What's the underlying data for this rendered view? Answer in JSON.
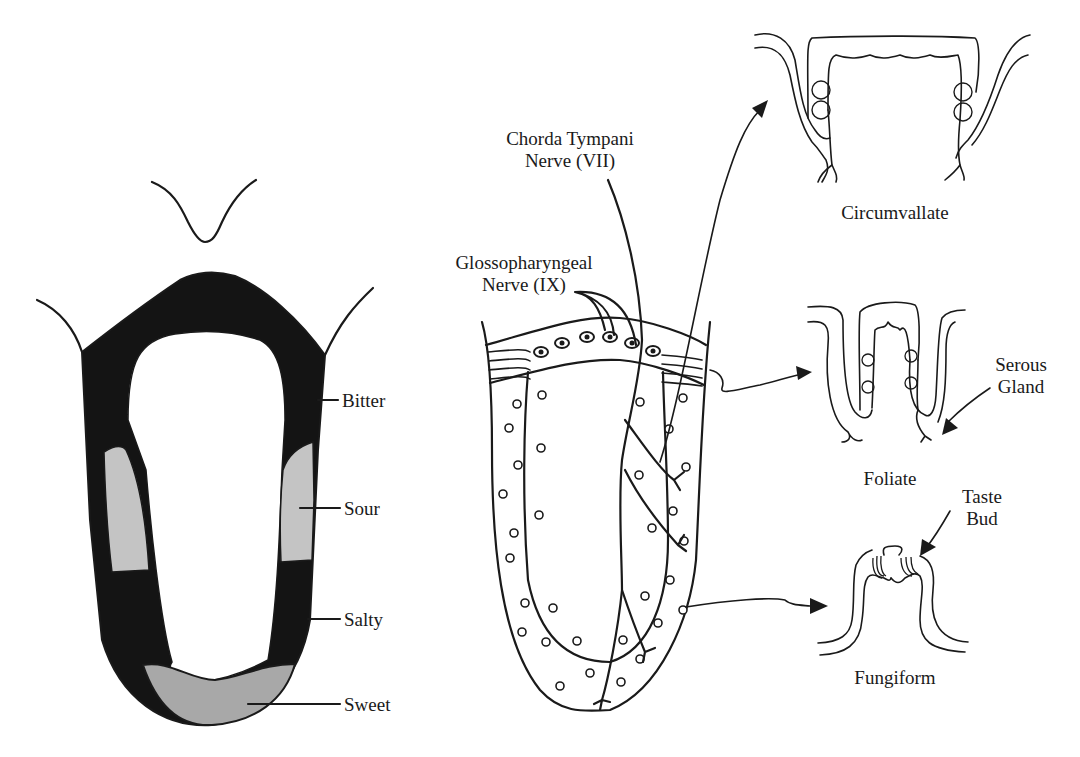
{
  "tongue_map": {
    "regions": [
      {
        "label": "Bitter",
        "fill": "#141414"
      },
      {
        "label": "Sour",
        "fill": "#c4c4c4"
      },
      {
        "label": "Salty",
        "fill": "#141414"
      },
      {
        "label": "Sweet",
        "fill": "#a8a8a8"
      }
    ]
  },
  "nerves": {
    "chorda_tympani": {
      "line1": "Chorda Tympani",
      "line2": "Nerve (VII)"
    },
    "glossopharyngeal": {
      "line1": "Glossopharyngeal",
      "line2": "Nerve (IX)"
    }
  },
  "papillae": {
    "circumvallate": "Circumvallate",
    "foliate": "Foliate",
    "fungiform": "Fungiform"
  },
  "annotations": {
    "serous_gland": {
      "line1": "Serous",
      "line2": "Gland"
    },
    "taste_bud": {
      "line1": "Taste",
      "line2": "Bud"
    }
  },
  "colors": {
    "ink": "#1a1a1a",
    "dark_region": "#141414",
    "light_region": "#c4c4c4",
    "sweet_region": "#a8a8a8"
  }
}
